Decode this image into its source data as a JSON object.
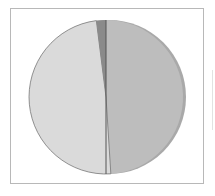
{
  "chart_data": {
    "type": "pie",
    "title": "",
    "categories": [
      "Slice A",
      "Slice B",
      "Slice C"
    ],
    "values": [
      49,
      49,
      2
    ],
    "colors": [
      "#bdbdbd",
      "#dadada",
      "#8a8a8a"
    ],
    "start_angle_deg": 0,
    "direction": "clockwise",
    "legend": "none",
    "data_labels": "none",
    "style": "3d-pie",
    "frame": true
  },
  "layout": {
    "cx": 106,
    "cy": 97,
    "r": 77,
    "rim_color": "#a9a9a9",
    "separator_color": "#555555"
  }
}
